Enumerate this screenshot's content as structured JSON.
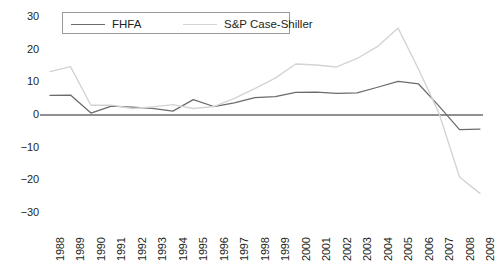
{
  "chart_data": {
    "type": "line",
    "title": "",
    "subtitle": "",
    "xlabel": "",
    "ylabel": "",
    "x": [
      1988,
      1989,
      1990,
      1991,
      1992,
      1993,
      1994,
      1995,
      1996,
      1997,
      1998,
      1999,
      2000,
      2001,
      2002,
      2003,
      2004,
      2005,
      2006,
      2007,
      2008,
      2009
    ],
    "categories": [
      "1988",
      "1989",
      "1990",
      "1991",
      "1992",
      "1993",
      "1994",
      "1995",
      "1996",
      "1997",
      "1998",
      "1999",
      "2000",
      "2001",
      "2002",
      "2003",
      "2004",
      "2005",
      "2006",
      "2007",
      "2008",
      "2009"
    ],
    "series": [
      {
        "name": "FHFA",
        "color": "#6b6b6b",
        "values": [
          6.0,
          6.1,
          0.6,
          2.7,
          2.4,
          2.0,
          1.2,
          4.7,
          2.6,
          3.7,
          5.3,
          5.6,
          6.9,
          7.0,
          6.6,
          6.8,
          8.5,
          10.3,
          9.5,
          2.7,
          -4.5,
          -4.3
        ]
      },
      {
        "name": "S&P Case-Shiller",
        "color": "#d3d3d3",
        "values": [
          13.3,
          14.8,
          3.0,
          3.0,
          2.0,
          2.5,
          3.2,
          2.0,
          2.6,
          5.1,
          8.1,
          11.3,
          15.6,
          15.3,
          14.7,
          17.3,
          21.0,
          26.6,
          14.0,
          0.5,
          -19.0,
          -24.0
        ]
      }
    ],
    "ylim": [
      -30,
      30
    ],
    "yticks": [
      30,
      20,
      10,
      0,
      -10,
      -20,
      -30
    ],
    "ytick_labels": [
      "30",
      "20",
      "10",
      "0",
      "−10",
      "−20",
      "−30"
    ],
    "xlim": [
      1988,
      2009
    ],
    "grid": false,
    "zero_line": true,
    "legend": {
      "position": "top-center",
      "entries": [
        {
          "label": "FHFA",
          "color": "#6b6b6b"
        },
        {
          "label": "S&P Case-Shiller",
          "color": "#d3d3d3"
        }
      ]
    },
    "axis_color": "#6b6b6b"
  }
}
